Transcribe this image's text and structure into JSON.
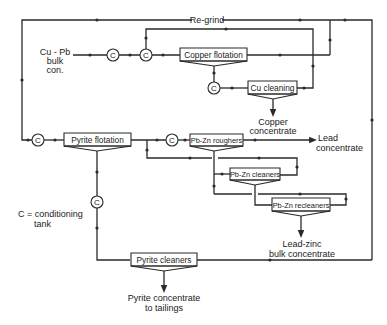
{
  "diagram": {
    "type": "flowsheet",
    "legend": {
      "line1": "C = conditioning",
      "line2": "tank"
    },
    "conditioner_symbol": "C",
    "feed": {
      "line1": "Cu - Pb",
      "line2": "bulk",
      "line3": "con."
    },
    "regrind_label": "Re-grind",
    "units": {
      "copper_flotation": "Copper flotation",
      "cu_cleaning": "Cu cleaning",
      "pyrite_flotation": "Pyrite flotation",
      "pbzn_roughers": "Pb-Zn roughers",
      "pbzn_cleaners": "Pb-Zn cleaners",
      "pbzn_recleaners": "Pb-Zn recleaners",
      "pyrite_cleaners": "Pyrite cleaners"
    },
    "products": {
      "copper_concentrate": {
        "line1": "Copper",
        "line2": "concentrate"
      },
      "lead_concentrate": {
        "line1": "Lead",
        "line2": "concentrate"
      },
      "leadzinc_bulk": {
        "line1": "Lead-zinc",
        "line2": "bulk concentrate"
      },
      "pyrite_concentrate": {
        "line1": "Pyrite concentrate",
        "line2": "to tailings"
      }
    },
    "line_color": "#2a2a2a",
    "background": "#ffffff"
  }
}
